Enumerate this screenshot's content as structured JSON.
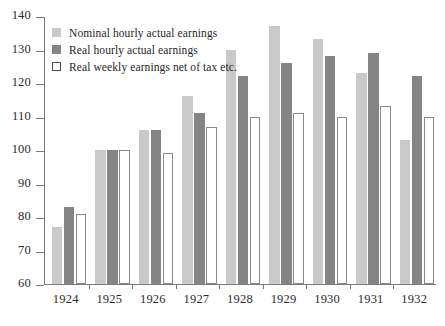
{
  "chart_data": {
    "type": "bar",
    "title": "",
    "xlabel": "",
    "ylabel": "",
    "ylim": [
      60,
      140
    ],
    "yticks": [
      60,
      70,
      80,
      90,
      100,
      110,
      120,
      130,
      140
    ],
    "grid": false,
    "legend_position": "top-left",
    "categories": [
      "1924",
      "1925",
      "1926",
      "1927",
      "1928",
      "1929",
      "1930",
      "1931",
      "1932"
    ],
    "series": [
      {
        "name": "Nominal hourly actual earnings",
        "color": "#c9c9c9",
        "values": [
          77,
          100,
          106,
          116,
          130,
          137,
          133,
          123,
          103
        ]
      },
      {
        "name": "Real hourly actual earnings",
        "color": "#858585",
        "values": [
          83,
          100,
          106,
          111,
          122,
          126,
          128,
          129,
          122
        ]
      },
      {
        "name": "Real weekly earnings net of tax etc.",
        "color": "#ffffff",
        "values": [
          81,
          100,
          99,
          107,
          110,
          111,
          110,
          113,
          110
        ]
      }
    ]
  },
  "legend": {
    "items": [
      {
        "label": "Nominal hourly actual earnings",
        "swatch": "nominal"
      },
      {
        "label": "Real hourly actual earnings",
        "swatch": "realhour"
      },
      {
        "label": "Real weekly earnings net of tax etc.",
        "swatch": "realweek"
      }
    ]
  }
}
